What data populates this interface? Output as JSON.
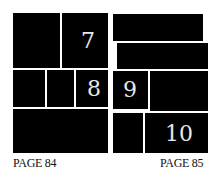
{
  "pages": [
    {
      "label": "PAGE 84",
      "panels": [
        {
          "id": "p84-r1-left",
          "number": ""
        },
        {
          "id": "p84-r1-right",
          "number": "7"
        },
        {
          "id": "p84-r2-a",
          "number": ""
        },
        {
          "id": "p84-r2-b",
          "number": ""
        },
        {
          "id": "p84-r2-c",
          "number": "8"
        },
        {
          "id": "p84-r3",
          "number": ""
        }
      ]
    },
    {
      "label": "PAGE 85",
      "panels": [
        {
          "id": "p85-r1",
          "number": ""
        },
        {
          "id": "p85-r2",
          "number": ""
        },
        {
          "id": "p85-r3-left",
          "number": "9"
        },
        {
          "id": "p85-r3-right",
          "number": ""
        },
        {
          "id": "p85-r4-left",
          "number": ""
        },
        {
          "id": "p85-r4-right",
          "number": "10"
        }
      ]
    }
  ],
  "colors": {
    "panel": "#000000",
    "gutter": "#ffffff",
    "number": "#e8e8e8"
  }
}
